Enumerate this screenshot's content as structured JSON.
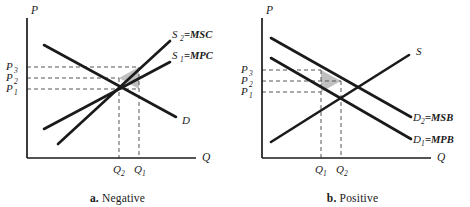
{
  "figure": {
    "title_implicit": "Externalities: negative and positive",
    "axis_label_price": "P",
    "axis_label_quantity": "Q"
  },
  "panels": [
    {
      "id": "a",
      "caption_letter": "a.",
      "caption_text": "Negative",
      "axes": {
        "y": "P",
        "x": "Q"
      },
      "price_ticks": [
        "P3",
        "P2",
        "P1"
      ],
      "price_ticks_display": [
        "P",
        "P",
        "P"
      ],
      "price_subscripts": [
        "3",
        "2",
        "1"
      ],
      "quantity_ticks_display": [
        "Q",
        "Q"
      ],
      "quantity_subscripts": [
        "2",
        "1"
      ],
      "curves": [
        {
          "name": "supply-social",
          "label_main": "S",
          "label_sub": "2",
          "label_eq": "=MSC"
        },
        {
          "name": "supply-private",
          "label_main": "S",
          "label_sub": "1",
          "label_eq": "=MPC"
        },
        {
          "name": "demand",
          "label_main": "D",
          "label_sub": "",
          "label_eq": ""
        }
      ],
      "shaded_region": "deadweight-loss-triangle"
    },
    {
      "id": "b",
      "caption_letter": "b.",
      "caption_text": "Positive",
      "axes": {
        "y": "P",
        "x": "Q"
      },
      "price_ticks": [
        "P3",
        "P2",
        "P1"
      ],
      "price_ticks_display": [
        "P",
        "P",
        "P"
      ],
      "price_subscripts": [
        "3",
        "2",
        "1"
      ],
      "quantity_ticks_display": [
        "Q",
        "Q"
      ],
      "quantity_subscripts": [
        "1",
        "2"
      ],
      "curves": [
        {
          "name": "supply",
          "label_main": "S",
          "label_sub": "",
          "label_eq": ""
        },
        {
          "name": "demand-social",
          "label_main": "D",
          "label_sub": "2",
          "label_eq": "=MSB"
        },
        {
          "name": "demand-private",
          "label_main": "D",
          "label_sub": "1",
          "label_eq": "=MPB"
        }
      ],
      "shaded_region": "deadweight-loss-triangle"
    }
  ],
  "colors": {
    "line": "#1a1a1a",
    "dashed": "#555555",
    "shade_fill": "#c0c0c0",
    "background": "#ffffff"
  }
}
